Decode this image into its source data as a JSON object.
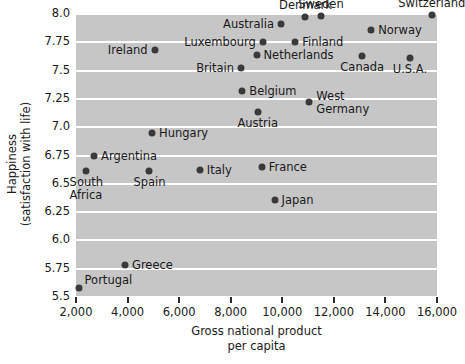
{
  "chart_data": {
    "type": "scatter",
    "title": "",
    "xlabel": "Gross national product per capita",
    "xlabel_line1": "Gross national product",
    "xlabel_line2": "per capita",
    "ylabel": "Happiness (satisfaction with life)",
    "ylabel_line1": "Happiness (satisfaction with life)",
    "ylabel_part1": "Happiness",
    "ylabel_part2": "(satisfaction with life)",
    "xlim": [
      2000,
      16000
    ],
    "ylim": [
      5.5,
      8.0
    ],
    "xticks": [
      2000,
      4000,
      6000,
      8000,
      10000,
      12000,
      14000,
      16000
    ],
    "xtick_labels": [
      "2,000",
      "4,000",
      "6,000",
      "8,000",
      "10,000",
      "12,000",
      "14,000",
      "16,000"
    ],
    "yticks": [
      5.5,
      5.75,
      6.0,
      6.25,
      6.5,
      6.75,
      7.0,
      7.25,
      7.5,
      7.75,
      8.0
    ],
    "ytick_labels": [
      "5.5",
      "5.75",
      "6.0",
      "6.25",
      "6.5",
      "6.75",
      "7.0",
      "7.25",
      "7.5",
      "7.75",
      "8.0"
    ],
    "grid": true,
    "grid_color": "#ffffff",
    "panel_color": "#c6c6c6",
    "marker_color": "#3a3a3a",
    "legend": "none",
    "points": [
      {
        "name": "Switzerland",
        "x": 15800,
        "y": 7.99,
        "label_pos": "above"
      },
      {
        "name": "Sweden",
        "x": 11500,
        "y": 7.98,
        "label_pos": "above"
      },
      {
        "name": "Denmark",
        "x": 10900,
        "y": 7.97,
        "label_pos": "above"
      },
      {
        "name": "Australia",
        "x": 9950,
        "y": 7.91,
        "label_pos": "left"
      },
      {
        "name": "Norway",
        "x": 13450,
        "y": 7.86,
        "label_pos": "right"
      },
      {
        "name": "Finland",
        "x": 10500,
        "y": 7.75,
        "label_pos": "right"
      },
      {
        "name": "Luxembourg",
        "x": 9250,
        "y": 7.75,
        "label_pos": "left"
      },
      {
        "name": "Ireland",
        "x": 5050,
        "y": 7.68,
        "label_pos": "left"
      },
      {
        "name": "Netherlands",
        "x": 9000,
        "y": 7.64,
        "label_pos": "right"
      },
      {
        "name": "Britain",
        "x": 8400,
        "y": 7.52,
        "label_pos": "left"
      },
      {
        "name": "Canada",
        "x": 13100,
        "y": 7.63,
        "label_pos": "below"
      },
      {
        "name": "U.S.A.",
        "x": 14950,
        "y": 7.61,
        "label_pos": "below"
      },
      {
        "name": "Belgium",
        "x": 8450,
        "y": 7.32,
        "label_pos": "right"
      },
      {
        "name": "West Germany",
        "x": 11050,
        "y": 7.22,
        "label_pos": "right"
      },
      {
        "name": "Austria",
        "x": 9050,
        "y": 7.13,
        "label_pos": "below"
      },
      {
        "name": "Hungary",
        "x": 4950,
        "y": 6.95,
        "label_pos": "right"
      },
      {
        "name": "Argentina",
        "x": 2700,
        "y": 6.75,
        "label_pos": "right"
      },
      {
        "name": "South Africa",
        "x": 2400,
        "y": 6.61,
        "label_pos": "below"
      },
      {
        "name": "Spain",
        "x": 4850,
        "y": 6.61,
        "label_pos": "below"
      },
      {
        "name": "Italy",
        "x": 6800,
        "y": 6.62,
        "label_pos": "right"
      },
      {
        "name": "France",
        "x": 9200,
        "y": 6.65,
        "label_pos": "right"
      },
      {
        "name": "Japan",
        "x": 9700,
        "y": 6.36,
        "label_pos": "right"
      },
      {
        "name": "Greece",
        "x": 3900,
        "y": 5.78,
        "label_pos": "right"
      },
      {
        "name": "Portugal",
        "x": 2100,
        "y": 5.58,
        "label_pos": "above-right"
      }
    ]
  }
}
